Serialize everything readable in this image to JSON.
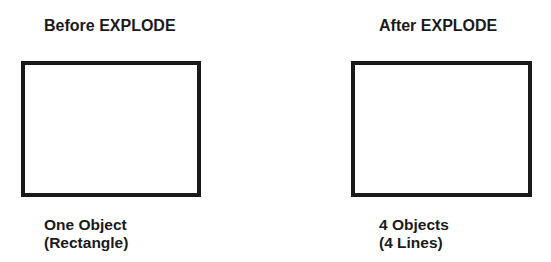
{
  "panels": [
    {
      "title": "Before EXPLODE",
      "caption_line1": "One Object",
      "caption_line2": "(Rectangle)",
      "shape": "rectangle"
    },
    {
      "title": "After EXPLODE",
      "caption_line1": "4 Objects",
      "caption_line2": "(4 Lines)",
      "shape": "rectangle"
    }
  ],
  "colors": {
    "stroke": "#1a1a1a",
    "background": "#ffffff"
  }
}
